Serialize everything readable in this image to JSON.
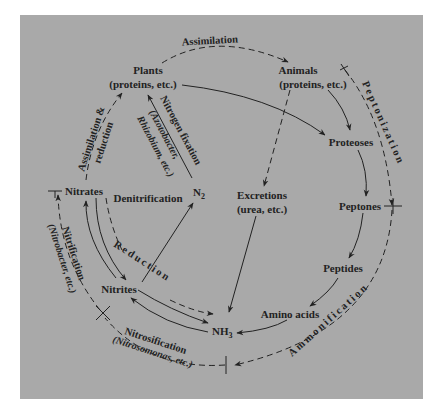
{
  "diagram": {
    "background_color": "#a9a9a9",
    "ink_color": "#222222",
    "nodes": {
      "plants": {
        "line1": "Plants",
        "line2": "(proteins, etc.)"
      },
      "animals": {
        "line1": "Animals",
        "line2": "(proteins, etc.)"
      },
      "proteoses": "Proteoses",
      "peptones": "Peptones",
      "peptides": "Peptides",
      "amino_acids": "Amino acids",
      "nh3": {
        "base": "NH",
        "sub": "3"
      },
      "nitrites": "Nitrites",
      "nitrates": "Nitrates",
      "n2": {
        "base": "N",
        "sub": "2"
      },
      "excretions": {
        "line1": "Excretions",
        "line2": "(urea, etc.)"
      }
    },
    "processes": {
      "assimilation_top": "Assimilation",
      "peptonization": "Peptonization",
      "ammonification": "Ammonification",
      "nitrosification": "Nitrosification",
      "nitrosification_agent": "(Nitrosomonas, etc.)",
      "nitrification": "Nitrification",
      "nitrification_agent": "(Nitrobacter, etc.)",
      "assimilation_reduction_1": "Assimilation &",
      "assimilation_reduction_2": "reduction",
      "nitrogen_fixation": "Nitrogen fixation",
      "nitrogen_fixation_agent_1": "(Azotobacter,",
      "nitrogen_fixation_agent_2": "Rhizobium, etc.)",
      "denitrification": "Denitrification",
      "reduction": "Reduction"
    },
    "edges": [
      {
        "from": "plants",
        "to": "animals",
        "style": "dashed",
        "label": "Assimilation"
      },
      {
        "from": "plants",
        "to": "proteoses",
        "style": "solid"
      },
      {
        "from": "animals",
        "to": "proteoses",
        "style": "solid"
      },
      {
        "from": "animals",
        "to": "excretions",
        "style": "dashed"
      },
      {
        "from": "proteoses",
        "to": "peptones",
        "style": "solid"
      },
      {
        "from": "peptones",
        "to": "peptides",
        "style": "solid"
      },
      {
        "from": "peptides",
        "to": "amino_acids",
        "style": "solid"
      },
      {
        "from": "amino_acids",
        "to": "nh3",
        "style": "solid"
      },
      {
        "from": "excretions",
        "to": "nh3",
        "style": "solid"
      },
      {
        "from": "nh3",
        "to": "nitrites",
        "style": "solid"
      },
      {
        "from": "nitrites",
        "to": "nh3",
        "style": "solid"
      },
      {
        "from": "nitrites",
        "to": "nh3",
        "style": "dashed",
        "label": "Reduction"
      },
      {
        "from": "nitrites",
        "to": "nitrates",
        "style": "solid"
      },
      {
        "from": "nitrates",
        "to": "nitrites",
        "style": "solid"
      },
      {
        "from": "nitrates",
        "to": "nitrites",
        "style": "dashed"
      },
      {
        "from": "nitrites",
        "to": "n2",
        "style": "solid",
        "label": "Denitrification"
      },
      {
        "from": "n2",
        "to": "plants",
        "style": "solid",
        "label": "Nitrogen fixation"
      },
      {
        "from": "nitrates",
        "to": "plants",
        "style": "dashed",
        "label": "Assimilation & reduction"
      }
    ]
  }
}
